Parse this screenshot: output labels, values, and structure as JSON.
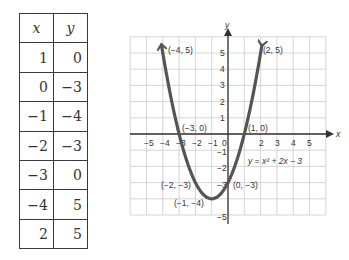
{
  "table": {
    "headers": [
      "x",
      "y"
    ],
    "rows": [
      [
        "1",
        "0"
      ],
      [
        "0",
        "−3"
      ],
      [
        "−1",
        "−4"
      ],
      [
        "−2",
        "−3"
      ],
      [
        "−3",
        "0"
      ],
      [
        "−4",
        "5"
      ],
      [
        "2",
        "5"
      ]
    ]
  },
  "graph": {
    "x_axis_label": "x",
    "y_axis_label": "y",
    "x_ticks": [
      "−5",
      "−4",
      "−3",
      "−2",
      "−1",
      "0",
      "2",
      "3",
      "4",
      "5"
    ],
    "y_ticks": [
      "5",
      "4",
      "3",
      "2",
      "1",
      "−1",
      "−2",
      "−3",
      "−5"
    ],
    "equation": "y = x² + 2x − 3",
    "points": [
      {
        "label": "(−4, 5)",
        "x": -4,
        "y": 5
      },
      {
        "label": "(2, 5)",
        "x": 2,
        "y": 5
      },
      {
        "label": "(−3, 0)",
        "x": -3,
        "y": 0
      },
      {
        "label": "(1, 0)",
        "x": 1,
        "y": 0
      },
      {
        "label": "(−2, −3)",
        "x": -2,
        "y": -3
      },
      {
        "label": "(0, −3)",
        "x": 0,
        "y": -3
      },
      {
        "label": "(−1, −4)",
        "x": -1,
        "y": -4
      }
    ],
    "curve_color": "#555555",
    "grid_color": "#cccccc"
  },
  "chart_data": {
    "type": "line",
    "title": "",
    "xlabel": "x",
    "ylabel": "y",
    "equation": "y = x^2 + 2x - 3",
    "x": [
      -4,
      -3,
      -2,
      -1,
      0,
      1,
      2
    ],
    "series": [
      {
        "name": "y = x^2 + 2x - 3",
        "values": [
          5,
          0,
          -3,
          -4,
          -3,
          0,
          5
        ]
      }
    ],
    "xlim": [
      -6,
      6
    ],
    "ylim": [
      -5,
      6
    ],
    "grid": true,
    "annotations": [
      "(-4, 5)",
      "(2, 5)",
      "(-3, 0)",
      "(1, 0)",
      "(-2, -3)",
      "(0, -3)",
      "(-1, -4)"
    ]
  }
}
